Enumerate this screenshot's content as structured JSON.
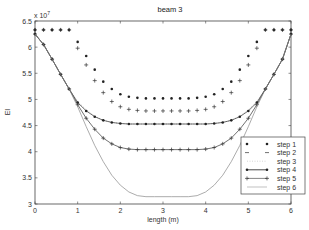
{
  "chart_data": {
    "type": "line",
    "title": "beam 3",
    "xlabel": "length (m)",
    "ylabel": "EI",
    "y_multiplier": "x 10^7",
    "xlim": [
      0,
      6
    ],
    "ylim": [
      3,
      6.5
    ],
    "xticks": [
      "0",
      "1",
      "2",
      "3",
      "4",
      "5",
      "6"
    ],
    "yticks": [
      "3",
      "3.5",
      "4",
      "4.5",
      "5",
      "5.5",
      "6",
      "6.5"
    ],
    "grid": false,
    "legend_position": "lower right",
    "x": [
      0,
      0.2,
      0.4,
      0.6,
      0.8,
      1.0,
      1.2,
      1.4,
      1.6,
      1.8,
      2.0,
      2.2,
      2.4,
      2.6,
      2.8,
      3.0,
      3.2,
      3.4,
      3.6,
      3.8,
      4.0,
      4.2,
      4.4,
      4.6,
      4.8,
      5.0,
      5.2,
      5.4,
      5.6,
      5.8,
      6.0
    ],
    "series": [
      {
        "name": "step 1",
        "style": "dots",
        "values": [
          6.33,
          6.33,
          6.33,
          6.33,
          6.33,
          6.1,
          5.83,
          5.57,
          5.34,
          5.2,
          5.1,
          5.05,
          5.03,
          5.02,
          5.02,
          5.02,
          5.02,
          5.02,
          5.02,
          5.03,
          5.05,
          5.1,
          5.2,
          5.34,
          5.57,
          5.83,
          6.1,
          6.33,
          6.33,
          6.33,
          6.33
        ]
      },
      {
        "name": "step 2",
        "style": "plus",
        "values": [
          6.33,
          6.33,
          6.33,
          6.33,
          6.33,
          5.98,
          5.66,
          5.36,
          5.13,
          4.96,
          4.86,
          4.81,
          4.79,
          4.78,
          4.78,
          4.78,
          4.78,
          4.78,
          4.78,
          4.79,
          4.81,
          4.86,
          4.96,
          5.13,
          5.36,
          5.66,
          5.98,
          6.33,
          6.33,
          6.33,
          6.33
        ]
      },
      {
        "name": "step 3",
        "style": "dotted",
        "values": [
          6.25,
          6.05,
          5.77,
          5.48,
          5.2,
          4.96,
          4.8,
          4.68,
          4.6,
          4.56,
          4.54,
          4.53,
          4.53,
          4.53,
          4.53,
          4.53,
          4.53,
          4.53,
          4.53,
          4.53,
          4.53,
          4.54,
          4.56,
          4.6,
          4.68,
          4.8,
          4.96,
          5.2,
          5.48,
          5.77,
          6.25
        ]
      },
      {
        "name": "step 4",
        "style": "line-star",
        "values": [
          6.25,
          6.05,
          5.77,
          5.48,
          5.2,
          4.94,
          4.78,
          4.67,
          4.6,
          4.56,
          4.54,
          4.53,
          4.53,
          4.53,
          4.53,
          4.53,
          4.53,
          4.53,
          4.53,
          4.53,
          4.53,
          4.54,
          4.56,
          4.6,
          4.67,
          4.78,
          4.94,
          5.2,
          5.48,
          5.77,
          6.25
        ]
      },
      {
        "name": "step 5",
        "style": "line-plus",
        "values": [
          6.25,
          6.05,
          5.77,
          5.48,
          5.2,
          4.9,
          4.64,
          4.43,
          4.26,
          4.15,
          4.08,
          4.05,
          4.04,
          4.04,
          4.04,
          4.04,
          4.04,
          4.04,
          4.04,
          4.04,
          4.05,
          4.08,
          4.15,
          4.26,
          4.43,
          4.64,
          4.9,
          5.2,
          5.48,
          5.77,
          6.25
        ]
      },
      {
        "name": "step 6",
        "style": "line",
        "values": [
          6.25,
          6.05,
          5.77,
          5.48,
          5.2,
          4.86,
          4.48,
          4.12,
          3.81,
          3.55,
          3.36,
          3.23,
          3.16,
          3.14,
          3.14,
          3.14,
          3.14,
          3.14,
          3.14,
          3.16,
          3.23,
          3.36,
          3.55,
          3.81,
          4.12,
          4.48,
          4.86,
          5.2,
          5.48,
          5.77,
          6.25
        ]
      }
    ]
  }
}
